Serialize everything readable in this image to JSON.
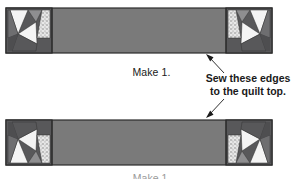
{
  "figure": {
    "type": "quilt-border-assembly-diagram",
    "background": "#ffffff",
    "width": 303,
    "height": 179
  },
  "labels": {
    "make_label": "Make 1.",
    "sew_note_line1": "Sew these edges",
    "sew_note_line2": "to the quilt top.",
    "bottom_clipped_label": "Make 1."
  },
  "palette": {
    "center_bar": "#7a7a7a",
    "dark_triangle": "#58585a",
    "medium_triangle": "#9a9a9c",
    "light_triangle": "#f2f2f2",
    "stipple_base": "#e4e4e4",
    "stipple_dot": "#8a8a8a",
    "outline": "#2b2b2b",
    "text": "#1a1a1a",
    "leader_line": "#1a1a1a"
  },
  "geometry": {
    "strip_left": 6,
    "strip_right": 272,
    "block_width": 46,
    "top_strip_y": 8,
    "bottom_strip_y": 120,
    "strip_height": 45
  },
  "strips": [
    {
      "name": "top-border-strip",
      "y": 8,
      "orientation": "normal",
      "left_block": "corner-block-pieced",
      "center": "plain-dark-bar",
      "right_block": "corner-block-pieced-mirrored"
    },
    {
      "name": "bottom-border-strip",
      "y": 120,
      "orientation": "vertically-mirrored",
      "left_block": "corner-block-pieced",
      "center": "plain-dark-bar",
      "right_block": "corner-block-pieced-mirrored"
    }
  ],
  "annotations": [
    {
      "name": "arrow-to-top-strip",
      "from_x": 222,
      "from_y": 72,
      "to_x": 208,
      "to_y": 55,
      "points_to": "top-border-strip"
    },
    {
      "name": "arrow-to-bottom-strip",
      "from_x": 222,
      "from_y": 100,
      "to_x": 208,
      "to_y": 118,
      "points_to": "bottom-border-strip"
    }
  ]
}
